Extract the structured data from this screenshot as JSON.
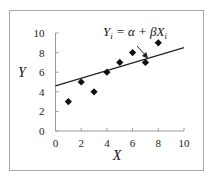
{
  "chart_data": {
    "type": "scatter",
    "title": "",
    "xlabel": "X",
    "ylabel": "Y",
    "xlim": [
      0,
      10
    ],
    "ylim": [
      0,
      10
    ],
    "x_ticks": [
      "0",
      "2",
      "4",
      "6",
      "8",
      "10"
    ],
    "y_ticks": [
      "0",
      "2",
      "4",
      "6",
      "8",
      "10"
    ],
    "grid": false,
    "legend": null,
    "series": [
      {
        "name": "observations",
        "marker": "diamond",
        "color": "#111111",
        "points": [
          {
            "x": 1,
            "y": 3
          },
          {
            "x": 2,
            "y": 5
          },
          {
            "x": 3,
            "y": 4
          },
          {
            "x": 4,
            "y": 6
          },
          {
            "x": 5,
            "y": 7
          },
          {
            "x": 6,
            "y": 8
          },
          {
            "x": 7,
            "y": 7
          },
          {
            "x": 8,
            "y": 9
          }
        ]
      },
      {
        "name": "regression line",
        "type": "line",
        "color": "#222222",
        "points": [
          {
            "x": 0,
            "y": 4.6
          },
          {
            "x": 10,
            "y": 8.5
          }
        ]
      }
    ],
    "annotations": [
      {
        "text": "Yi = α + βXi",
        "points_to": {
          "x": 7.2,
          "y": 7.4
        },
        "arrow": true
      }
    ]
  },
  "labels": {
    "xlabel": "X",
    "ylabel": "Y",
    "eq_Y": "Y",
    "eq_sub_i": "i",
    "eq_mid": " = α + βX",
    "eq_sub_i2": "i"
  }
}
